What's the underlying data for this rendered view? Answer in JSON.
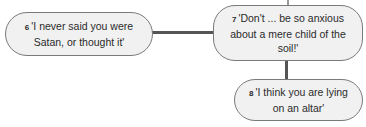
{
  "diagram": {
    "nodes": [
      {
        "id": "6",
        "number": "6",
        "text": "'I never said you were Satan, or thought it'"
      },
      {
        "id": "7",
        "number": "7",
        "text": "'Don't ... be so anxious about a mere child of the soil!'"
      },
      {
        "id": "8",
        "number": "8",
        "text": "'I think you are lying on an altar'"
      }
    ],
    "edges": [
      {
        "from": "6",
        "to": "7"
      },
      {
        "from": "7",
        "to": "8"
      }
    ],
    "colors": {
      "node_fill": "#f1f1f1",
      "node_border": "#7a7a7a",
      "connector": "#555555",
      "text": "#2b2b2b"
    }
  }
}
